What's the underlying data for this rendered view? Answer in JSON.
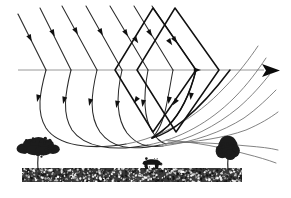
{
  "figure": {
    "background_color": "#ffffff"
  },
  "axis": {
    "name": "optical-axis",
    "color": "#8d8d8d",
    "y": 70,
    "x_start": 18,
    "x_end": 268,
    "arrow_label": "",
    "arrowhead_color": "#0a0a0a"
  },
  "rays": {
    "incoming_color": "#2b2b2b",
    "curved_color": "#2b2b2b",
    "emerging_color": "#6d6d6d",
    "bold_color": "#101010",
    "incoming_count": 7,
    "curved_count": 7,
    "emerging_count": 7,
    "arrow_marker_color": "#101010",
    "incoming_paths": [
      "M 18,14 L 46,70",
      "M 40,8 L 71,70",
      "M 62,6 L 97,70",
      "M 86,6 L 122,70",
      "M 110,6 L 148,70",
      "M 134,6 L 173,70",
      "M 152,6 L 196,70"
    ],
    "incoming_arrows": [
      {
        "x": 30,
        "y": 38,
        "angle": 63
      },
      {
        "x": 53,
        "y": 33,
        "angle": 63
      },
      {
        "x": 76,
        "y": 31,
        "angle": 61
      },
      {
        "x": 101,
        "y": 32,
        "angle": 61
      },
      {
        "x": 126,
        "y": 33,
        "angle": 59
      },
      {
        "x": 150,
        "y": 33,
        "angle": 59
      },
      {
        "x": 170,
        "y": 42,
        "angle": 56
      }
    ],
    "curved_paths": [
      "M 46,70 C 40,92 36,112 46,128 C 58,146 90,150 126,144",
      "M 71,70 C 65,94 62,114 72,130 C 84,147 112,152 148,145",
      "M 97,70 C 91,95 89,116 100,132 C 112,148 130,151 160,145",
      "M 122,70 C 116,96 116,118 127,133 C 136,144 146,148 163,146",
      "M 148,70 C 143,97 144,118 152,131 C 157,139 160,142 166,144",
      "M 173,70 C 168,96 166,116 158,130 C 156,134 154,136 152,138",
      "M 196,70 C 190,94 182,112 168,126 C 162,132 157,136 153,138"
    ],
    "curved_arrows": [
      {
        "x": 38,
        "y": 98,
        "angle": 104
      },
      {
        "x": 64,
        "y": 100,
        "angle": 104
      },
      {
        "x": 90,
        "y": 102,
        "angle": 103
      },
      {
        "x": 117,
        "y": 104,
        "angle": 101
      },
      {
        "x": 143,
        "y": 103,
        "angle": 99
      },
      {
        "x": 169,
        "y": 100,
        "angle": 97
      },
      {
        "x": 191,
        "y": 96,
        "angle": 97
      }
    ],
    "emerging_paths": [
      "M 126,144 C 160,138 196,118 224,88 C 238,74 250,58 258,46",
      "M 148,145 C 180,139 210,122 234,98 C 248,84 258,70 266,58",
      "M 160,145 C 190,140 216,126 238,108 C 252,96 262,84 270,74",
      "M 163,146 C 194,142 222,132 244,118 C 258,108 268,98 276,90",
      "M 166,144 C 196,142 224,138 246,130 C 260,124 270,118 278,112",
      "M 168,142 C 198,142 226,144 248,146 C 260,147 270,148 278,150",
      "M 166,140 C 196,142 224,148 246,154 C 258,157 268,160 276,163"
    ],
    "bold_paths": [
      "M 153,8 L 196,70 L 153,132 L 115,70 Z",
      "M 175,8 L 219,70 L 176,132 L 137,70 Z",
      "M 196,70 C 190,94 182,112 168,126 C 160,133 155,136 152,138",
      "M 152,138 C 160,136 172,130 184,120 C 202,105 218,86 230,70"
    ],
    "bold_arrows": [
      {
        "x": 175,
        "y": 40,
        "angle": 55
      },
      {
        "x": 175,
        "y": 102,
        "angle": 125
      },
      {
        "x": 136,
        "y": 40,
        "angle": 55
      },
      {
        "x": 136,
        "y": 100,
        "angle": 125
      },
      {
        "x": 197,
        "y": 70,
        "angle": 0
      }
    ]
  },
  "landscape": {
    "ground": {
      "name": "stippled-ground-strip",
      "x": 22,
      "y": 168,
      "width": 220,
      "height": 14,
      "color": "#3a3a3a",
      "stipple_seed": 7
    },
    "trees": [
      {
        "name": "palm-tree-left",
        "type": "palm",
        "x": 38,
        "base_y": 170,
        "height": 30,
        "canopy_width": 34,
        "color": "#1c1c1c"
      },
      {
        "name": "round-tree-right",
        "type": "broadleaf",
        "x": 228,
        "base_y": 170,
        "height": 28,
        "canopy_width": 22,
        "color": "#1c1c1c"
      }
    ],
    "animal": {
      "name": "cow-silhouette",
      "type": "cow",
      "x": 152,
      "base_y": 169,
      "width": 20,
      "height": 12,
      "color": "#151515"
    }
  }
}
